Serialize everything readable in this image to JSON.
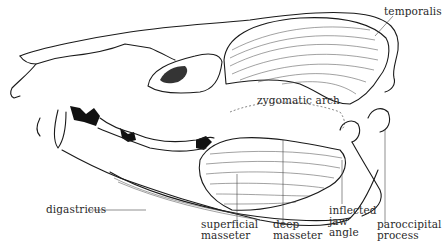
{
  "figure": {
    "labels": {
      "temporalis": "temporalis",
      "zygomatic_arch": "zygomatic arch",
      "digastricus": "digastricus",
      "superficial_masseter": [
        "superficial",
        "masseter"
      ],
      "deep_masseter": [
        "deep",
        "masseter"
      ],
      "inflected_jaw_angle": [
        "inflected",
        "jaw",
        "angle"
      ],
      "paroccipital_process": [
        "paroccipital",
        "process"
      ]
    }
  }
}
